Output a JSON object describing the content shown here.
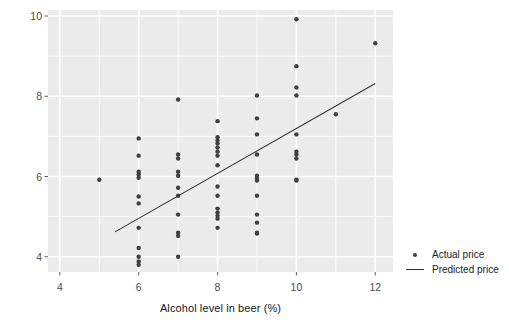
{
  "chart_data": {
    "type": "scatter",
    "title": "",
    "xlabel": "Alcohol level in beer (%)",
    "ylabel": "Price of beer per bottle (Euro)",
    "xlim": [
      3.7,
      12.45
    ],
    "ylim": [
      3.62,
      10.15
    ],
    "xticks": [
      4,
      6,
      8,
      10,
      12
    ],
    "yticks": [
      4,
      6,
      8,
      10
    ],
    "grid": true,
    "legend_position": "right",
    "legend": [
      {
        "label": "Actual price",
        "marker": "dot",
        "color": "#404040"
      },
      {
        "label": "Predicted price",
        "marker": "line",
        "color": "#333333"
      }
    ],
    "series": [
      {
        "name": "Actual price",
        "type": "scatter",
        "marker": "dot",
        "color": "#404040",
        "x": [
          5.0,
          6.0,
          6.0,
          6.0,
          6.0,
          6.0,
          6.0,
          6.0,
          6.0,
          6.0,
          6.0,
          6.0,
          6.0,
          7.0,
          7.0,
          7.0,
          7.0,
          7.0,
          7.0,
          7.0,
          7.0,
          7.0,
          7.0,
          7.0,
          8.0,
          8.0,
          8.0,
          8.0,
          8.0,
          8.0,
          8.0,
          8.0,
          8.0,
          8.0,
          8.0,
          8.0,
          8.0,
          8.0,
          8.0,
          9.0,
          9.0,
          9.0,
          9.0,
          9.0,
          9.0,
          9.0,
          9.0,
          9.0,
          9.0,
          9.0,
          9.0,
          10.0,
          10.0,
          10.0,
          10.0,
          10.0,
          10.0,
          10.0,
          10.0,
          10.0,
          10.0,
          11.0,
          12.0
        ],
        "y": [
          5.92,
          6.95,
          6.52,
          6.12,
          6.05,
          5.97,
          5.5,
          5.33,
          4.72,
          4.22,
          4.0,
          3.88,
          3.8,
          7.92,
          6.55,
          6.45,
          6.12,
          6.02,
          5.72,
          5.52,
          5.05,
          4.6,
          4.52,
          4.0,
          7.38,
          6.98,
          6.9,
          6.82,
          6.72,
          6.62,
          6.52,
          6.28,
          5.75,
          5.52,
          5.2,
          5.1,
          5.02,
          4.95,
          4.72,
          8.02,
          7.45,
          7.05,
          6.55,
          6.02,
          5.95,
          5.9,
          5.52,
          5.05,
          4.85,
          4.6,
          4.58,
          9.92,
          8.75,
          8.22,
          8.02,
          7.05,
          6.62,
          6.55,
          6.45,
          5.92,
          5.9,
          7.55,
          9.32
        ]
      },
      {
        "name": "Predicted price",
        "type": "line",
        "color": "#333333",
        "x": [
          5.4,
          12.0
        ],
        "y": [
          4.62,
          8.32
        ]
      }
    ]
  },
  "style": {
    "panel_background": "#ebebeb",
    "grid_color": "#ffffff",
    "point_color": "#404040",
    "line_color": "#333333",
    "tick_label_color": "#4d4d4d",
    "axis_label_color": "#1a1a1a"
  }
}
